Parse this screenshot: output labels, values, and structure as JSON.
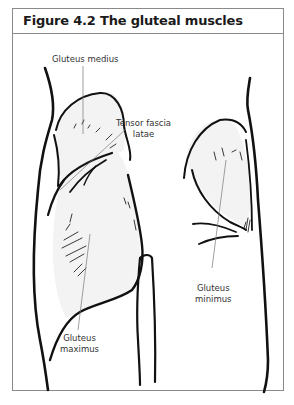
{
  "figure": {
    "title": "Figure 4.2 The gluteal muscles",
    "labels": {
      "gluteus_medius": "Gluteus medius",
      "tensor_fascia_latae_line1": "Tensor fascia",
      "tensor_fascia_latae_line2": "latae",
      "gluteus_maximus_line1": "Gluteus",
      "gluteus_maximus_line2": "maximus",
      "gluteus_minimus_line1": "Gluteus",
      "gluteus_minimus_line2": "minimus"
    },
    "colors": {
      "border": "#8a8a8a",
      "outline": "#111111",
      "muscle_fill": "#f2f2f2",
      "leader_line": "#777777"
    }
  }
}
